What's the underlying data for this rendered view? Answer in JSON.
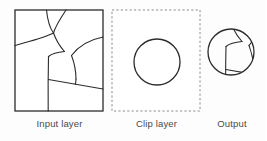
{
  "diagram": {
    "type": "geoprocessing-clip-illustration",
    "background_color": "#fdfdfd",
    "stroke_color": "#2b2b2b",
    "label_color": "#4a4a4a",
    "panels": [
      {
        "id": "input-layer",
        "label": "Input layer",
        "border_style": "solid",
        "contents": "irregular polygon boundaries / parcel lines"
      },
      {
        "id": "clip-layer",
        "label": "Clip layer",
        "border_style": "dashed",
        "contents": "single circle"
      },
      {
        "id": "output",
        "label": "Output",
        "border_style": "none",
        "contents": "circle containing clipped polygon boundaries"
      }
    ],
    "geometry": {
      "input_box": {
        "x": 15,
        "y": 10,
        "width": 88,
        "height": 101
      },
      "clip_box": {
        "x": 112,
        "y": 10,
        "width": 88,
        "height": 101
      },
      "clip_circle": {
        "cx": 157,
        "cy": 62,
        "r": 23
      },
      "output_circle": {
        "cx": 231,
        "cy": 52,
        "r": 23
      }
    }
  }
}
